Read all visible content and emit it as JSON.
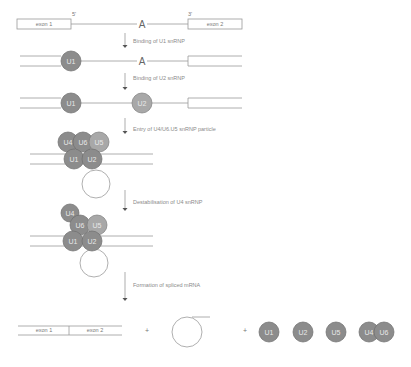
{
  "labels": {
    "exon1": "exon 1",
    "exon2": "exon 2",
    "five_prime": "5'",
    "three_prime": "3'",
    "branch_point": "A",
    "plus": "+"
  },
  "steps": [
    {
      "label": "Binding of U1 snRNP"
    },
    {
      "label": "Binding of U2 snRNP"
    },
    {
      "label": "Entry of U4/U6.U5 snRNP particle"
    },
    {
      "label": "Destabilisation of U4 snRNP"
    },
    {
      "label": "Formation of spliced mRNA"
    }
  ],
  "snrnps": {
    "u1": "U1",
    "u2": "U2",
    "u4": "U4",
    "u5": "U5",
    "u6": "U6"
  },
  "products": {
    "mrna": [
      "exon 1",
      "exon 2"
    ],
    "lariat": "lariat intron",
    "released": [
      "U1",
      "U2",
      "U5",
      "U4",
      "U6"
    ]
  }
}
